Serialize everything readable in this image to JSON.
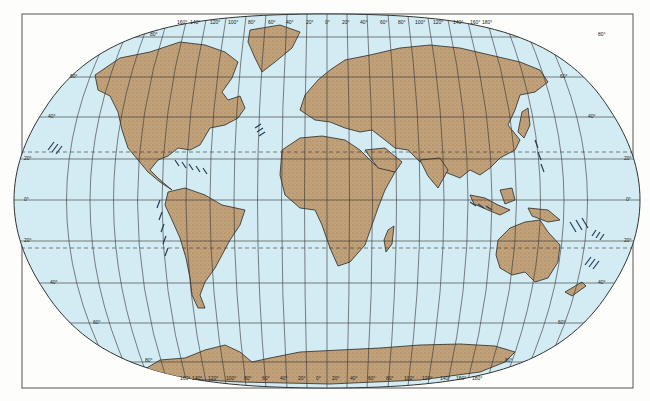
{
  "map": {
    "projection": "Winkel Tripel world map",
    "colors": {
      "ocean": "#d3ebf3",
      "land": "#c2a27a",
      "land_outline": "#2a2a2a",
      "graticule": "#333333",
      "frame": "#555555",
      "trench": "#1f3f5a",
      "background": "#fdfdfb"
    },
    "longitude_labels_top": [
      "160°",
      "140°",
      "120°",
      "100°",
      "80°",
      "60°",
      "40°",
      "20°",
      "0°",
      "20°",
      "40°",
      "60°",
      "80°",
      "100°",
      "120°",
      "140°",
      "160°",
      "180°"
    ],
    "longitude_labels_bottom": [
      "160°",
      "140°",
      "120°",
      "100°",
      "80°",
      "60°",
      "40°",
      "20°",
      "0°",
      "20°",
      "40°",
      "60°",
      "80°",
      "100°",
      "120°",
      "140°",
      "160°",
      "180°"
    ],
    "latitude_labels_left": [
      "80°",
      "60°",
      "40°",
      "20°",
      "0°",
      "20°",
      "40°",
      "60°",
      "80°"
    ],
    "latitude_labels_right": [
      "80°",
      "60°",
      "40°",
      "20°",
      "0°",
      "20°",
      "40°",
      "60°",
      "80°"
    ],
    "tropics": [
      "Tropic of Cancer",
      "Tropic of Capricorn"
    ],
    "continents": [
      "North America",
      "South America",
      "Greenland",
      "Europe",
      "Asia",
      "Africa",
      "Australia",
      "Antarctica",
      "Madagascar",
      "New Zealand",
      "Japan",
      "Indonesia"
    ]
  }
}
